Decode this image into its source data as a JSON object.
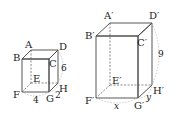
{
  "diagram": {
    "small_cuboid": {
      "vertices": [
        "A",
        "B",
        "C",
        "D",
        "E",
        "F",
        "G",
        "H"
      ],
      "dimensions": {
        "FG": "4",
        "GH": "2",
        "DH": "6"
      }
    },
    "large_cuboid": {
      "vertices": [
        "A′",
        "B′",
        "C′",
        "D′",
        "E′",
        "F′",
        "G′",
        "H′"
      ],
      "dimensions": {
        "F′G′": "x",
        "G′H′": "y",
        "D′H′": "9"
      }
    },
    "colors": {
      "front_face": "#c9c9c9",
      "side_face": "#9a9a9a",
      "top_face": "#e2e2e2"
    }
  }
}
